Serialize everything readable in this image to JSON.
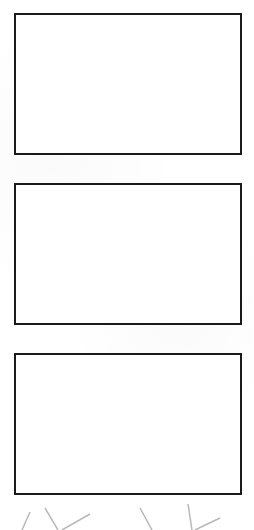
{
  "panels": [
    {
      "id": "panel-1",
      "content": ""
    },
    {
      "id": "panel-2",
      "content": ""
    },
    {
      "id": "panel-3",
      "content": ""
    }
  ],
  "colors": {
    "background": "#ffffff",
    "border": "#1a1a1a",
    "decoration": "#9a9a9a"
  }
}
